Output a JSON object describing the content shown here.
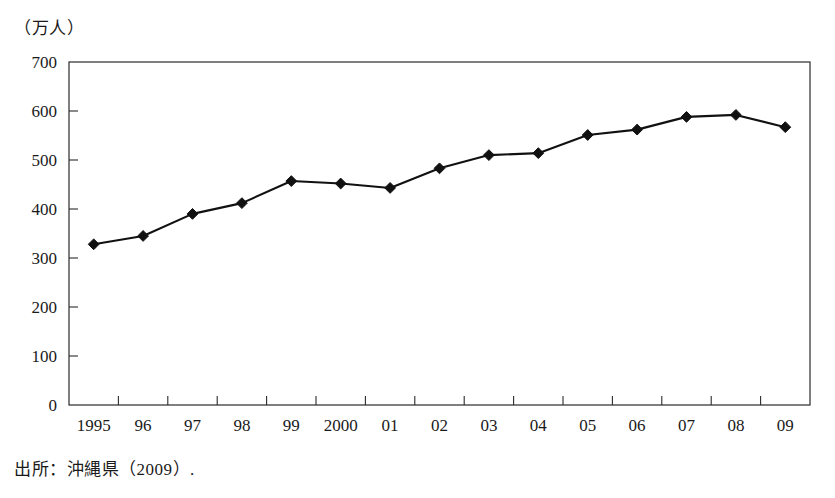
{
  "figure": {
    "unit_label": "（万人）",
    "source_note": "出所：沖縄県（2009）."
  },
  "chart_data": {
    "type": "line",
    "title": "",
    "subtitle": "",
    "xlabel": "",
    "ylabel": "（万人）",
    "categories": [
      "1995",
      "96",
      "97",
      "98",
      "99",
      "2000",
      "01",
      "02",
      "03",
      "04",
      "05",
      "06",
      "07",
      "08",
      "09"
    ],
    "values": [
      328,
      345,
      390,
      412,
      457,
      452,
      443,
      483,
      510,
      514,
      551,
      562,
      588,
      592,
      567
    ],
    "series": [
      {
        "name": "入域観光客数",
        "values": [
          328,
          345,
          390,
          412,
          457,
          452,
          443,
          483,
          510,
          514,
          551,
          562,
          588,
          592,
          567
        ]
      }
    ],
    "ylim": [
      0,
      700
    ],
    "ytick_values": [
      0,
      100,
      200,
      300,
      400,
      500,
      600,
      700
    ],
    "ytick_labels": [
      "0",
      "100",
      "200",
      "300",
      "400",
      "500",
      "600",
      "700"
    ],
    "grid": false,
    "legend": false,
    "legend_position": "none",
    "marker": "diamond",
    "line_color": "#111111",
    "marker_color": "#111111",
    "axis_color": "#2b2b2b"
  }
}
